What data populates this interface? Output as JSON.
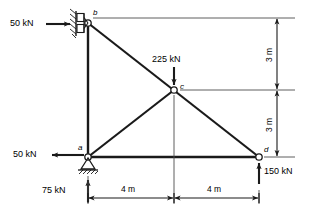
{
  "figure": {
    "type": "truss-free-body-diagram",
    "joints": [
      {
        "id": "b",
        "label": "b",
        "x": 4,
        "y": 6,
        "support": "roller-vertical-wall"
      },
      {
        "id": "c",
        "label": "c",
        "x": 8,
        "y": 3,
        "support": "none"
      },
      {
        "id": "a",
        "label": "a",
        "x": 4,
        "y": 0,
        "support": "pin"
      },
      {
        "id": "d",
        "label": "d",
        "x": 12,
        "y": 0,
        "support": "none"
      }
    ],
    "members": [
      {
        "from": "b",
        "to": "a"
      },
      {
        "from": "b",
        "to": "c"
      },
      {
        "from": "c",
        "to": "d"
      },
      {
        "from": "a",
        "to": "c"
      },
      {
        "from": "a",
        "to": "d"
      }
    ],
    "forces": [
      {
        "id": "load-b",
        "label": "50 kN",
        "direction": "right",
        "at": "b"
      },
      {
        "id": "load-c",
        "label": "225 kN",
        "direction": "down",
        "at": "c"
      },
      {
        "id": "load-a",
        "label": "50 kN",
        "direction": "left",
        "at": "a"
      },
      {
        "id": "reaction-a",
        "label": "75 kN",
        "direction": "up",
        "at": "a"
      },
      {
        "id": "reaction-d",
        "label": "150 kN",
        "direction": "up",
        "at": "d"
      }
    ],
    "dimensions": [
      {
        "id": "height-upper",
        "label": "3 m",
        "orientation": "vertical"
      },
      {
        "id": "height-lower",
        "label": "3 m",
        "orientation": "vertical"
      },
      {
        "id": "span-left",
        "label": "4 m",
        "orientation": "horizontal"
      },
      {
        "id": "span-right",
        "label": "4 m",
        "orientation": "horizontal"
      }
    ],
    "colors": {
      "line": "#1a1a1a",
      "background": "#ffffff"
    }
  }
}
